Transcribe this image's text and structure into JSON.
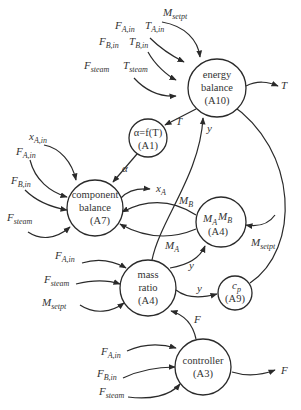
{
  "diagram": {
    "nodes": {
      "energy_balance": {
        "line1": "energy",
        "line2": "balance",
        "line3": "(A10)"
      },
      "alpha": {
        "line1": "α=f(T)",
        "line2": "(A1)"
      },
      "component_balance": {
        "line1": "component",
        "line2": "balance",
        "line3": "(A7)"
      },
      "mamb": {
        "line1a": "M",
        "line1a_sub": "A",
        "line1b": "M",
        "line1b_sub": "B",
        "line2": "(A4)"
      },
      "mass_ratio": {
        "line1": "mass",
        "line2": "ratio",
        "line3": "(A4)"
      },
      "cp": {
        "line1": "c",
        "line1_sub": "p",
        "line2": "(A9)"
      },
      "controller": {
        "line1": "controller",
        "line2": "(A3)"
      }
    },
    "labels": {
      "eb_in_msetpt": {
        "main": "M",
        "sub": "setpt"
      },
      "eb_in_fa": {
        "main": "F",
        "sub": "A,in"
      },
      "eb_in_ta": {
        "main": "T",
        "sub": "A,in"
      },
      "eb_in_fb": {
        "main": "F",
        "sub": "B,in"
      },
      "eb_in_tb": {
        "main": "T",
        "sub": "B,in"
      },
      "eb_in_fsteam": {
        "main": "F",
        "sub": "steam"
      },
      "eb_in_tsteam": {
        "main": "T",
        "sub": "steam"
      },
      "eb_out_T": {
        "main": "T"
      },
      "eb_to_alpha_T": {
        "main": "T"
      },
      "y_to_eb": {
        "main": "y"
      },
      "alpha_out": {
        "main": "α"
      },
      "cb_in_xa": {
        "main": "x",
        "sub": "A,in"
      },
      "cb_in_fa": {
        "main": "F",
        "sub": "A,in"
      },
      "cb_in_fb": {
        "main": "F",
        "sub": "B,in"
      },
      "cb_in_fsteam": {
        "main": "F",
        "sub": "steam"
      },
      "cb_out_xa": {
        "main": "x",
        "sub": "A"
      },
      "mb_label": {
        "main": "M",
        "sub": "B"
      },
      "ma_label": {
        "main": "M",
        "sub": "A"
      },
      "mamb_in_msetpt": {
        "main": "M",
        "sub": "setpt"
      },
      "mr_y_up": {
        "main": "y"
      },
      "mr_y_cp": {
        "main": "y"
      },
      "mr_in_fa": {
        "main": "F",
        "sub": "A,in"
      },
      "mr_in_fsteam": {
        "main": "F",
        "sub": "steam"
      },
      "mr_in_msetpt": {
        "main": "M",
        "sub": "setpt"
      },
      "ctrl_F_up": {
        "main": "F"
      },
      "ctrl_in_fa": {
        "main": "F",
        "sub": "A,in"
      },
      "ctrl_in_fb": {
        "main": "F",
        "sub": "B,in"
      },
      "ctrl_in_fsteam": {
        "main": "F",
        "sub": "steam"
      },
      "ctrl_out_F": {
        "main": "F"
      }
    }
  }
}
